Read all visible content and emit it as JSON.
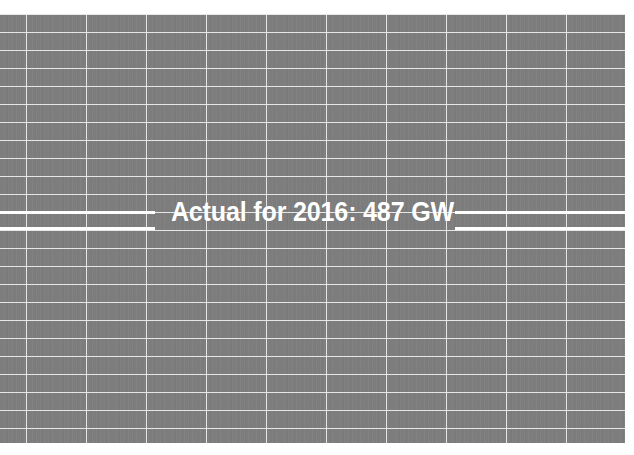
{
  "chart_data": {
    "type": "line",
    "title": "",
    "subtitle": "",
    "xlabel": "",
    "ylabel": "",
    "annotations": [
      {
        "text": "Actual for 2016: 487 GW",
        "value": 487,
        "unit": "GW",
        "year": 2016,
        "kind": "reference-line-label",
        "color": "#ffffff"
      }
    ],
    "reference_lines": [
      {
        "name": "upper-leader-line",
        "y_px": 197,
        "color": "#ffffff"
      },
      {
        "name": "lower-leader-line",
        "y_px": 213,
        "color": "#ffffff"
      }
    ],
    "grid": {
      "visible": true,
      "color": "#efefef",
      "horizontal_count": 24,
      "vertical_count": 10,
      "horizontal_spacing_px": 18,
      "vertical_spacing_px": 60
    },
    "legend": {
      "visible": false,
      "entries": []
    },
    "plot_background": "#7d7d7d",
    "page_background": "#ffffff",
    "categories": [],
    "values": [],
    "xticklabels": [],
    "yticklabels": []
  },
  "annotation": {
    "label": "Actual for 2016: 487 GW"
  },
  "colors": {
    "plot_fill": "#7d7d7d",
    "grid": "#efefef",
    "annotation": "#ffffff",
    "page": "#ffffff"
  }
}
